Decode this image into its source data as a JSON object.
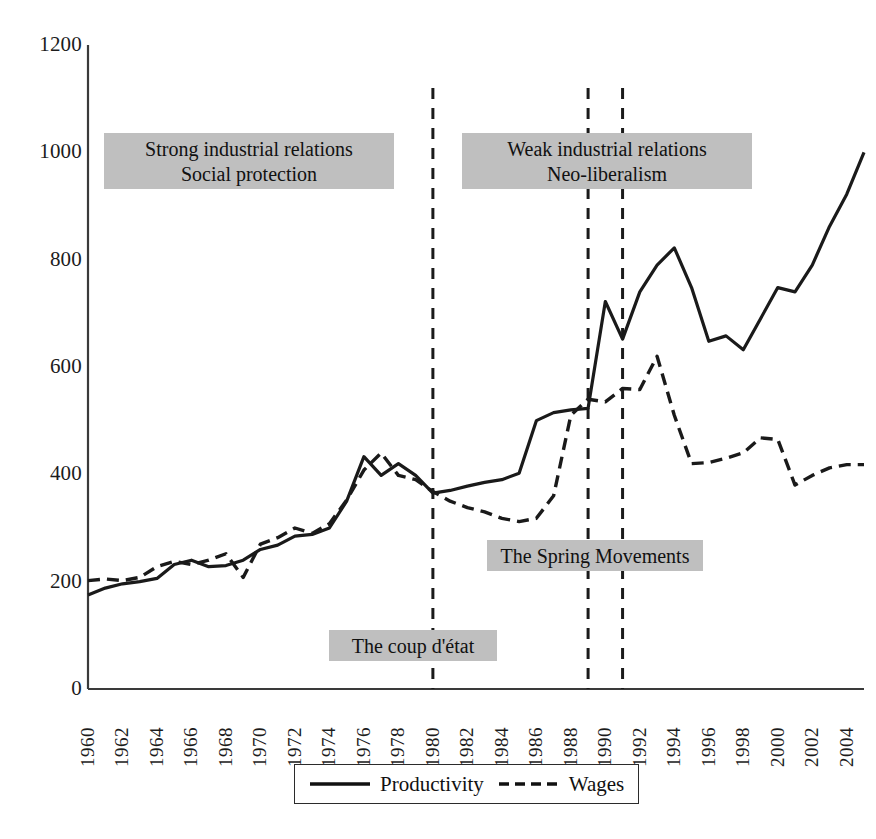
{
  "figure": {
    "background_color": "#ffffff",
    "plot_area": {
      "left": 88,
      "top": 45,
      "right": 864,
      "bottom": 689
    },
    "axis_color": "#3a3a3a",
    "series_color": "#1a1a1a",
    "annotation_fill": "#bfbfbf"
  },
  "chart_data": {
    "type": "line",
    "title": "",
    "subtitle": "",
    "xlabel": "",
    "ylabel": "",
    "xlim": [
      1960,
      2005
    ],
    "ylim": [
      0,
      1200
    ],
    "grid": false,
    "legend_position": "bottom",
    "x": [
      1960,
      1961,
      1962,
      1963,
      1964,
      1965,
      1966,
      1967,
      1968,
      1969,
      1970,
      1971,
      1972,
      1973,
      1974,
      1975,
      1976,
      1977,
      1978,
      1979,
      1980,
      1981,
      1982,
      1983,
      1984,
      1985,
      1986,
      1987,
      1988,
      1989,
      1990,
      1991,
      1992,
      1993,
      1994,
      1995,
      1996,
      1997,
      1998,
      1999,
      2000,
      2001,
      2002,
      2003,
      2004,
      2005
    ],
    "xtick_labels": [
      "1960",
      "1962",
      "1964",
      "1966",
      "1968",
      "1970",
      "1972",
      "1974",
      "1976",
      "1978",
      "1980",
      "1982",
      "1984",
      "1986",
      "1988",
      "1990",
      "1992",
      "1994",
      "1996",
      "1998",
      "2000",
      "2002",
      "2004"
    ],
    "ytick_labels": [
      "0",
      "200",
      "400",
      "600",
      "800",
      "1000",
      "1200"
    ],
    "ytick_values": [
      0,
      200,
      400,
      600,
      800,
      1000,
      1200
    ],
    "series": [
      {
        "name": "Productivity",
        "style": "solid",
        "values": [
          175,
          188,
          196,
          200,
          206,
          232,
          240,
          228,
          230,
          240,
          260,
          268,
          285,
          288,
          300,
          350,
          433,
          398,
          420,
          398,
          365,
          370,
          378,
          385,
          390,
          402,
          500,
          515,
          520,
          523,
          722,
          652,
          740,
          790,
          822,
          748,
          648,
          658,
          632,
          690,
          748,
          740,
          790,
          862,
          922,
          1000
        ]
      },
      {
        "name": "Wages",
        "style": "dashed",
        "values": [
          202,
          205,
          202,
          208,
          228,
          238,
          232,
          240,
          252,
          208,
          270,
          282,
          300,
          290,
          308,
          352,
          408,
          440,
          398,
          390,
          368,
          350,
          338,
          330,
          318,
          312,
          318,
          360,
          510,
          540,
          535,
          560,
          558,
          620,
          510,
          420,
          422,
          430,
          440,
          468,
          465,
          380,
          398,
          412,
          418,
          418
        ]
      }
    ],
    "event_markers": [
      {
        "label": "The coup d'état",
        "x": 1980,
        "style": "dashed-vertical"
      },
      {
        "label": "The Spring Movements",
        "x": 1989,
        "style": "dashed-vertical"
      },
      {
        "label": "The Spring Movements",
        "x": 1991,
        "style": "dashed-vertical"
      }
    ],
    "annotations": [
      {
        "id": "era-left",
        "lines": [
          "Strong industrial relations",
          "Social protection"
        ],
        "box": {
          "left": 104,
          "top": 133,
          "width": 290,
          "height": 56
        }
      },
      {
        "id": "era-right",
        "lines": [
          "Weak industrial relations",
          "Neo-liberalism"
        ],
        "box": {
          "left": 462,
          "top": 133,
          "width": 290,
          "height": 56
        }
      },
      {
        "id": "spring-movements",
        "lines": [
          "The Spring Movements"
        ],
        "box": {
          "left": 487,
          "top": 540,
          "width": 216,
          "height": 31
        }
      },
      {
        "id": "coup-detat",
        "lines": [
          "The coup d'état"
        ],
        "box": {
          "left": 329,
          "top": 630,
          "width": 168,
          "height": 31
        }
      }
    ]
  },
  "legend": {
    "entries": [
      {
        "label": "Productivity",
        "style": "solid"
      },
      {
        "label": "Wages",
        "style": "dashed"
      }
    ]
  }
}
